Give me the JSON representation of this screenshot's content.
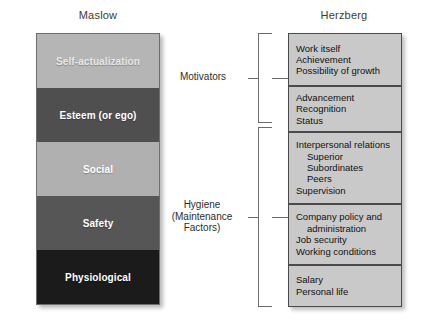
{
  "figure": {
    "maslow": {
      "title": "Maslow",
      "bands": [
        {
          "label": "Self-actualization",
          "fill": "#b5b5b5",
          "text": "#e8e8e8"
        },
        {
          "label": "Esteem (or ego)",
          "fill": "#4f4f4f",
          "text": "#ffffff"
        },
        {
          "label": "Social",
          "fill": "#b0b0b0",
          "text": "#ffffff"
        },
        {
          "label": "Safety",
          "fill": "#565656",
          "text": "#ffffff"
        },
        {
          "label": "Physiological",
          "fill": "#1b1b1b",
          "text": "#ffffff"
        }
      ]
    },
    "herzberg": {
      "title": "Herzberg",
      "box_fill": "#c9c9c9",
      "border_color": "#4a4a4a",
      "boxes": [
        {
          "lines": [
            {
              "text": "Work itself",
              "indent": false
            },
            {
              "text": "Achievement",
              "indent": false
            },
            {
              "text": "Possibility of growth",
              "indent": false
            }
          ]
        },
        {
          "lines": [
            {
              "text": "Advancement",
              "indent": false
            },
            {
              "text": "Recognition",
              "indent": false
            },
            {
              "text": "Status",
              "indent": false
            }
          ]
        },
        {
          "lines": [
            {
              "text": "Interpersonal relations",
              "indent": false
            },
            {
              "text": "Superior",
              "indent": true
            },
            {
              "text": "Subordinates",
              "indent": true
            },
            {
              "text": "Peers",
              "indent": true
            },
            {
              "text": "Supervision",
              "indent": false
            }
          ]
        },
        {
          "lines": [
            {
              "text": "Company policy and",
              "indent": false
            },
            {
              "text": "administration",
              "indent": true
            },
            {
              "text": "Job security",
              "indent": false
            },
            {
              "text": "Working conditions",
              "indent": false
            }
          ]
        },
        {
          "lines": [
            {
              "text": "Salary",
              "indent": false
            },
            {
              "text": "Personal life",
              "indent": false
            }
          ]
        }
      ]
    },
    "brackets": [
      {
        "label": "Motivators",
        "lines": [
          "Motivators"
        ]
      },
      {
        "label": "Hygiene (Maintenance Factors)",
        "lines": [
          "Hygiene",
          "(Maintenance",
          "Factors)"
        ]
      }
    ]
  }
}
